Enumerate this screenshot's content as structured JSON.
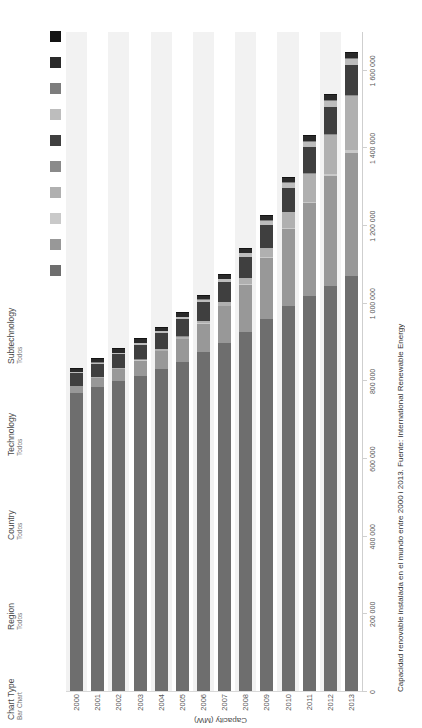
{
  "controls": [
    {
      "name": "chart-type",
      "title": "Chart Type",
      "value": "Bar Chart"
    },
    {
      "name": "region",
      "title": "Region",
      "value": "Todos"
    },
    {
      "name": "country",
      "title": "Country",
      "value": "Todos"
    },
    {
      "name": "technology",
      "title": "Technology",
      "value": "Todos"
    },
    {
      "name": "subtechnology",
      "title": "Subtechnology",
      "value": "Todos"
    }
  ],
  "legend": {
    "items": [
      {
        "label": "Hydropower",
        "color": "#6e6e6e"
      },
      {
        "label": "Onshore Wind",
        "color": "#989898"
      },
      {
        "label": "Offshore Wind",
        "color": "#c9c9c9"
      },
      {
        "label": "Solar Photovoltaic",
        "color": "#b0b0b0"
      },
      {
        "label": "Solar Thermal",
        "color": "#8a8a8a"
      },
      {
        "label": "Solid Biomass",
        "color": "#3f3f3f"
      },
      {
        "label": "Biogas",
        "color": "#bdbdbd"
      },
      {
        "label": "Liquid Biofuels",
        "color": "#7d7d7d"
      },
      {
        "label": "Geothermal Energy",
        "color": "#2a2a2a"
      },
      {
        "label": "Tide, Wave, and Ocean",
        "color": "#141414"
      }
    ]
  },
  "caption": "Capacidad renovable instalada en el mundo entre 2000 i 2013. Fuente: International Renewable Energy",
  "chart_data": {
    "type": "bar",
    "orientation": "vertical-rotated",
    "stacked": true,
    "title": "",
    "xlabel": "",
    "ylabel": "Capacity (MW)",
    "ylim": [
      0,
      1700000
    ],
    "yticks": [
      0,
      200000,
      400000,
      600000,
      800000,
      1000000,
      1200000,
      1400000,
      1600000
    ],
    "ytick_labels": [
      "0",
      "200 000",
      "400 000",
      "600 000",
      "800 000",
      "1 000 000",
      "1 200 000",
      "1 400 000",
      "1 600 000"
    ],
    "grid": false,
    "legend_position": "top-right",
    "categories": [
      "2000",
      "2001",
      "2002",
      "2003",
      "2004",
      "2005",
      "2006",
      "2007",
      "2008",
      "2009",
      "2010",
      "2011",
      "2012",
      "2013"
    ],
    "series": [
      {
        "name": "Hydropower",
        "values": [
          768000,
          784000,
          798000,
          812000,
          829000,
          848000,
          872000,
          897000,
          925000,
          957000,
          991000,
          1018000,
          1043000,
          1069000
        ]
      },
      {
        "name": "Onshore Wind",
        "values": [
          17000,
          23000,
          31000,
          39000,
          47000,
          59000,
          74000,
          94000,
          121000,
          159000,
          198000,
          238000,
          283000,
          318000
        ]
      },
      {
        "name": "Offshore Wind",
        "values": [
          100,
          200,
          300,
          500,
          600,
          700,
          800,
          1100,
          1500,
          2100,
          3100,
          4100,
          5400,
          7000
        ]
      },
      {
        "name": "Solar Photovoltaic",
        "values": [
          1000,
          1300,
          1700,
          2300,
          3500,
          5200,
          7000,
          9400,
          15500,
          23500,
          40500,
          72500,
          100500,
          139000
        ]
      },
      {
        "name": "Solar Thermal",
        "values": [
          400,
          400,
          400,
          400,
          400,
          400,
          400,
          500,
          500,
          700,
          1300,
          1800,
          2500,
          3400
        ]
      },
      {
        "name": "Solid Biomass",
        "values": [
          32000,
          34000,
          36000,
          38000,
          41000,
          44000,
          47000,
          51000,
          55000,
          59000,
          63000,
          67000,
          71000,
          75000
        ]
      },
      {
        "name": "Biogas",
        "values": [
          2500,
          3000,
          3400,
          4000,
          4700,
          5500,
          6400,
          7600,
          9000,
          10500,
          12000,
          13500,
          15000,
          16500
        ]
      },
      {
        "name": "Liquid Biofuels",
        "values": [
          500,
          600,
          700,
          800,
          900,
          1100,
          1300,
          1500,
          1800,
          2000,
          2200,
          2400,
          2600,
          2800
        ]
      },
      {
        "name": "Geothermal Energy",
        "values": [
          8000,
          8200,
          8400,
          8600,
          8800,
          9000,
          9300,
          9600,
          10000,
          10400,
          10800,
          11200,
          11600,
          12000
        ]
      },
      {
        "name": "Tide, Wave, and Ocean",
        "values": [
          260,
          260,
          260,
          260,
          260,
          260,
          260,
          260,
          260,
          500,
          500,
          500,
          500,
          500
        ]
      }
    ]
  }
}
